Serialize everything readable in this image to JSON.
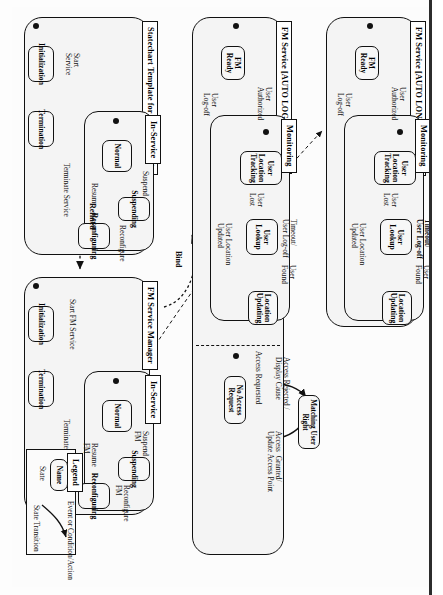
{
  "document": {
    "kind": "scanned-figure-page",
    "orientation": "rotated-90-clockwise"
  },
  "charts": [
    {
      "id": "fm-service-false",
      "title": "FM Service [AUTO LON-ON  == False]",
      "subregion_title": "Monitoring",
      "states": [
        {
          "name": "FM Ready"
        },
        {
          "name": "User\nLocation\nTracking"
        },
        {
          "name": "User\nLookup"
        },
        {
          "name": "Location\nUpdating"
        }
      ],
      "transitions": [
        {
          "label": "User\nAuthorized"
        },
        {
          "label": "User\nLog-off"
        },
        {
          "label": "User\nLost"
        },
        {
          "label": "Timeout/\nUser Log-off"
        },
        {
          "label": "User\nFound"
        },
        {
          "label": "User Location\nUpdated"
        }
      ]
    },
    {
      "id": "fm-service-true",
      "title": "FM Service [AUTO LOG-ON  == True]",
      "subregion_title": "Monitoring",
      "states": [
        {
          "name": "FM Ready"
        },
        {
          "name": "User\nLocation\nTracking"
        },
        {
          "name": "User\nLookup"
        },
        {
          "name": "Location\nUpdating"
        },
        {
          "name": "No Access Request"
        },
        {
          "name": "Matching User Right"
        }
      ],
      "transitions": [
        {
          "label": "User\nAuthorized"
        },
        {
          "label": "User\nLog-off"
        },
        {
          "label": "User\nLost"
        },
        {
          "label": "Timeout/\nUser Log-off"
        },
        {
          "label": "User\nFound"
        },
        {
          "label": "User Location\nUpdated"
        },
        {
          "label": "Access Requested"
        },
        {
          "label": "Access Rejected /\nDisplay Cause"
        },
        {
          "label": "Access  Granted/\nUpdate Access Point"
        }
      ]
    },
    {
      "id": "statechart-template",
      "title": "Statechart Template for a Binding Unit",
      "subregion_title": "In-Service",
      "states": [
        {
          "name": "Initialization"
        },
        {
          "name": "Termination"
        },
        {
          "name": "Normal"
        },
        {
          "name": "Suspending"
        },
        {
          "name": "Reconfiguring"
        }
      ],
      "transitions": [
        {
          "label": "Start\nService"
        },
        {
          "label": "Terminate Service"
        },
        {
          "label": "Suspend"
        },
        {
          "label": "Resume"
        },
        {
          "label": "Reconfigure"
        }
      ]
    },
    {
      "id": "fm-service-manager",
      "title": "FM Service Manager",
      "subregion_title": "In-Service",
      "states": [
        {
          "name": "Initialization"
        },
        {
          "name": "Termination"
        },
        {
          "name": "Normal"
        },
        {
          "name": "Suspending"
        },
        {
          "name": "Reconfiguring"
        }
      ],
      "transitions": [
        {
          "label": "Start FM Service"
        },
        {
          "label": "Terminate FM Service"
        },
        {
          "label": "Suspend\nFM"
        },
        {
          "label": "Resume\nFM"
        },
        {
          "label": "Reconfigure\nFM"
        }
      ]
    }
  ],
  "relations": {
    "refined": "Refined",
    "bind": "Bind"
  },
  "legend": {
    "title": "Legend",
    "state_sample_name": "Name",
    "state_caption": "State",
    "transition_caption": "State Transition",
    "transition_label": "Event or Condition/Action"
  }
}
